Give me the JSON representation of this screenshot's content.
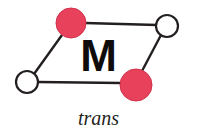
{
  "figure": {
    "background_color": "#ffffff",
    "width": 201,
    "height": 135,
    "metal_center_label": "M",
    "caption": "trans",
    "bond_color": "#231f20",
    "bond_width": 2.4,
    "filled_ligand_color": "#e8415c",
    "filled_ligand_stroke": "#d2304a",
    "open_ligand_fill": "#ffffff",
    "open_ligand_stroke": "#231f20"
  },
  "vertices": [
    {
      "id": "ligand-top-left",
      "type": "filled",
      "label": "",
      "cx": 71,
      "cy": 23,
      "r": 15
    },
    {
      "id": "ligand-top-right",
      "type": "open",
      "label": "",
      "cx": 167,
      "cy": 26,
      "r": 11
    },
    {
      "id": "ligand-bottom-left",
      "type": "open",
      "label": "",
      "cx": 27,
      "cy": 82,
      "r": 11
    },
    {
      "id": "ligand-bottom-right",
      "type": "filled",
      "label": "",
      "cx": 136,
      "cy": 85,
      "r": 16
    }
  ],
  "bonds": [
    {
      "id": "bond-top",
      "from": "ligand-top-left",
      "to": "ligand-top-right",
      "x1": 85,
      "y1": 23,
      "x2": 157,
      "y2": 25
    },
    {
      "id": "bond-left",
      "from": "ligand-bottom-left",
      "to": "ligand-top-left",
      "x1": 34,
      "y1": 74,
      "x2": 62,
      "y2": 35
    },
    {
      "id": "bond-bottom",
      "from": "ligand-bottom-left",
      "to": "ligand-bottom-right",
      "x1": 38,
      "y1": 82,
      "x2": 121,
      "y2": 83
    },
    {
      "id": "bond-right",
      "from": "ligand-top-right",
      "to": "ligand-bottom-right",
      "x1": 161,
      "y1": 35,
      "x2": 142,
      "y2": 71
    }
  ]
}
